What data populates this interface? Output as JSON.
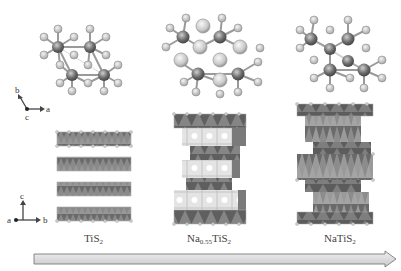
{
  "figure": {
    "type": "crystal-structure-diagram"
  },
  "axes": {
    "top": {
      "vertical": "b",
      "horizontal": "a",
      "out": "c"
    },
    "bottom": {
      "vertical": "c",
      "horizontal": "b",
      "out": "a"
    }
  },
  "compounds": [
    {
      "formula_main": "TiS",
      "subscript": "2",
      "full": "TiS2",
      "prefix": "",
      "prefix_sub": ""
    },
    {
      "formula_main": "TiS",
      "subscript": "2",
      "full": "Na0.55TiS2",
      "prefix": "Na",
      "prefix_sub": "0.55"
    },
    {
      "formula_main": "NaTiS",
      "subscript": "2",
      "full": "NaTiS2",
      "prefix": "",
      "prefix_sub": ""
    }
  ],
  "arrow": {
    "direction": "right",
    "meaning": "increasing Na content"
  },
  "colors": {
    "ti_atom": "#6e6e6e",
    "s_atom": "#b5b5b5",
    "na_atom": "#c8c8c8",
    "octahedra_dark": "#707070",
    "octahedra_light": "#a8a8a8",
    "na_layer": "#e8e8e8",
    "arrow_fill": "#dadada",
    "arrow_stroke": "#7a7a7a"
  }
}
